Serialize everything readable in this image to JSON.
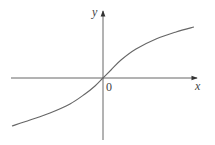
{
  "chart_data": {
    "type": "line",
    "title": "",
    "xlabel": "x",
    "ylabel": "y",
    "origin_label": "0",
    "grid": false,
    "legend": null,
    "axes": {
      "x_axis": {
        "from_px": [
          11,
          78
        ],
        "to_px": [
          198,
          78
        ],
        "arrow": true
      },
      "y_axis": {
        "from_px": [
          103,
          140
        ],
        "to_px": [
          103,
          10
        ],
        "arrow": true
      },
      "origin_px": [
        103,
        78
      ]
    },
    "series": [
      {
        "name": "curve",
        "description": "odd, increasing, concave-down for x>0 and concave-up for x<0, passing through origin (inverse-sinh / arctan-like shape)",
        "points_px": [
          [
            12,
            126
          ],
          [
            30,
            120
          ],
          [
            50,
            113
          ],
          [
            70,
            104
          ],
          [
            85,
            94
          ],
          [
            95,
            86
          ],
          [
            103,
            78
          ],
          [
            111,
            70
          ],
          [
            121,
            60
          ],
          [
            136,
            49
          ],
          [
            156,
            39
          ],
          [
            176,
            32
          ],
          [
            194,
            27
          ]
        ]
      }
    ]
  },
  "colors": {
    "axis": "#555555",
    "curve": "#666666",
    "background": "#ffffff"
  }
}
